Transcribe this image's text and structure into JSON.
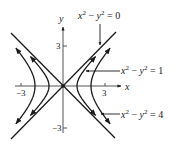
{
  "diagram": {
    "origin_px": [
      63,
      86
    ],
    "unit_px": 14,
    "colors": {
      "ink": "#1a1a1a",
      "background": "#ffffff"
    },
    "axes": {
      "x_label": "x",
      "y_label": "y",
      "x_ticks": [
        {
          "value": -3,
          "label": "−3"
        },
        {
          "value": 3,
          "label": "3"
        }
      ],
      "y_ticks": [
        {
          "value": 3,
          "label": "3"
        },
        {
          "value": -3,
          "label": "−3"
        }
      ]
    },
    "labels": {
      "c0": {
        "lhs_base1": "x",
        "sup1": "2",
        "minus": " − ",
        "lhs_base2": "y",
        "sup2": "2",
        "eq": " = 0"
      },
      "c1": {
        "lhs_base1": "x",
        "sup1": "2",
        "minus": " − ",
        "lhs_base2": "y",
        "sup2": "2",
        "eq": " = 1"
      },
      "c4": {
        "lhs_base1": "x",
        "sup1": "2",
        "minus": " − ",
        "lhs_base2": "y",
        "sup2": "2",
        "eq": " = 4"
      }
    }
  },
  "chart_data": {
    "type": "line",
    "title": "",
    "xlabel": "x",
    "ylabel": "y",
    "xlim": [
      -3.5,
      4
    ],
    "ylim": [
      -3.6,
      4
    ],
    "grid": false,
    "series": [
      {
        "name": "x^2 - y^2 = 0",
        "kind": "asymptotes",
        "equation": "y = ±x",
        "range": [
          -3.7,
          3.8
        ]
      },
      {
        "name": "x^2 - y^2 = 1",
        "kind": "hyperbola",
        "c": 1,
        "y_range": [
          -2.1,
          2.1
        ],
        "arrows": "outward at both ends, both branches"
      },
      {
        "name": "x^2 - y^2 = 4",
        "kind": "hyperbola",
        "c": 4,
        "y_range": [
          -2.7,
          2.7
        ],
        "arrows": "outward at both ends, both branches"
      }
    ],
    "annotations": [
      {
        "text": "x^2 - y^2 = 0",
        "points_to": "asymptote y = x"
      },
      {
        "text": "x^2 - y^2 = 1",
        "points_to": "right branch of c = 1"
      },
      {
        "text": "x^2 - y^2 = 4",
        "points_to": "right branch of c = 4"
      }
    ]
  }
}
